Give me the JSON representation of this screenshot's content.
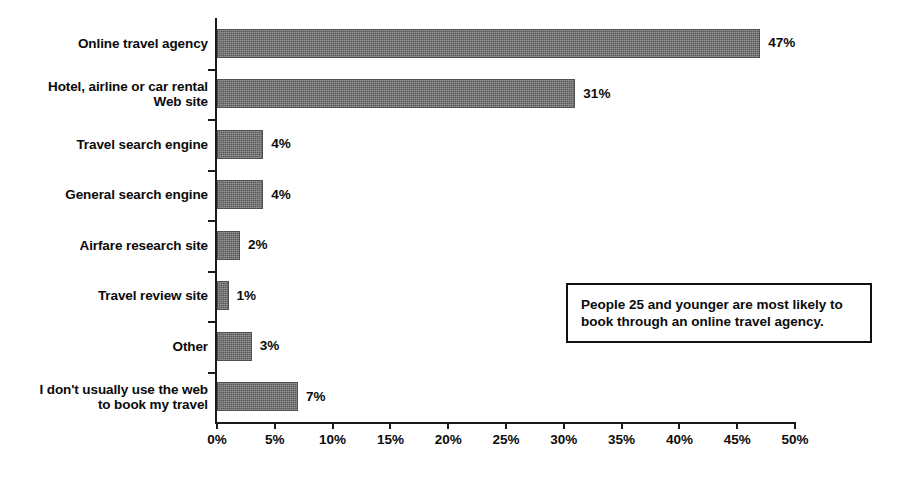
{
  "chart_data": {
    "type": "bar",
    "orientation": "horizontal",
    "title": "",
    "subtitle": "",
    "xlabel": "",
    "ylabel": "",
    "xlim": [
      0,
      50
    ],
    "ylim": null,
    "grid": false,
    "legend": null,
    "xtick_labels": [
      "0%",
      "5%",
      "10%",
      "15%",
      "20%",
      "25%",
      "30%",
      "35%",
      "40%",
      "45%",
      "50%"
    ],
    "xtick_values": [
      0,
      5,
      10,
      15,
      20,
      25,
      30,
      35,
      40,
      45,
      50
    ],
    "categories": [
      "Online travel agency",
      "Hotel, airline or car rental\nWeb site",
      "Travel search engine",
      "General search engine",
      "Airfare research site",
      "Travel review site",
      "Other",
      "I don't usually use the web\nto book my travel"
    ],
    "values": [
      47,
      31,
      4,
      4,
      2,
      1,
      3,
      7
    ],
    "value_labels": [
      "47%",
      "31%",
      "4%",
      "4%",
      "2%",
      "1%",
      "3%",
      "7%"
    ],
    "bar_color": "#6d6d6d",
    "bar_edge_color": "#4f4f4f",
    "axis_color": "#1a1a1a",
    "text_color": "#0b0b0b",
    "background_color": "#ffffff",
    "annotations": [
      {
        "text": "People 25 and younger are most likely to\nbook through an online travel agency.",
        "border_color": "#111111",
        "background_color": "#ffffff"
      }
    ]
  }
}
